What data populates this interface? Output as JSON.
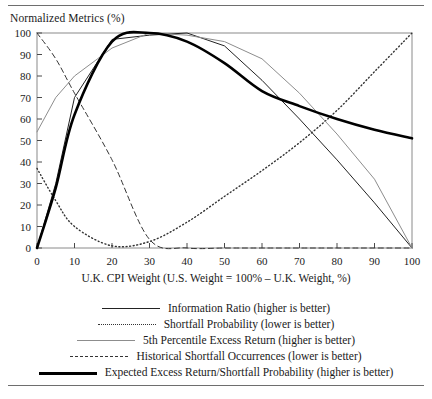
{
  "figure": {
    "y_axis_title": "Normalized Metrics (%)",
    "x_axis_title": "U.K. CPI Weight (U.S. Weight = 100% – U.K. Weight, %)"
  },
  "legend": {
    "entries": [
      {
        "label": "Information Ratio (higher is better)",
        "style": "solid-dark"
      },
      {
        "label": "Shortfall Probability (lower is better)",
        "style": "dotted"
      },
      {
        "label": "5th Percentile Excess Return (higher is better)",
        "style": "solid-light"
      },
      {
        "label": "Historical Shortfall Occurrences (lower is better)",
        "style": "dashed"
      },
      {
        "label": "Expected Excess Return/Shortfall Probability (higher is better)",
        "style": "bold"
      }
    ]
  },
  "chart_data": {
    "type": "line",
    "title": "",
    "xlabel": "U.K. CPI Weight (U.S. Weight = 100% – U.K. Weight, %)",
    "ylabel": "Normalized Metrics (%)",
    "xlim": [
      0,
      100
    ],
    "ylim": [
      0,
      100
    ],
    "grid": false,
    "legend_position": "below",
    "xticks": [
      0,
      10,
      20,
      30,
      40,
      50,
      60,
      70,
      80,
      90,
      100
    ],
    "yticks": [
      0,
      10,
      20,
      30,
      40,
      50,
      60,
      70,
      80,
      90,
      100
    ],
    "x": [
      0,
      5,
      10,
      20,
      30,
      40,
      50,
      60,
      70,
      80,
      90,
      100
    ],
    "series": [
      {
        "name": "Information Ratio (higher is better)",
        "style": "solid-dark",
        "color": "#222222",
        "values": [
          0,
          30,
          70,
          97,
          99,
          100,
          94,
          78,
          60,
          41,
          21,
          0
        ]
      },
      {
        "name": "Shortfall Probability (lower is better)",
        "style": "dotted",
        "color": "#333333",
        "values": [
          37,
          22,
          10,
          1,
          3,
          12,
          24,
          36,
          49,
          64,
          82,
          100
        ]
      },
      {
        "name": "5th Percentile Excess Return (higher is better)",
        "style": "solid-light",
        "color": "#8d8d8d",
        "values": [
          54,
          70,
          80,
          93,
          100,
          99,
          96,
          88,
          72,
          53,
          32,
          0
        ]
      },
      {
        "name": "Historical Shortfall Occurrences (lower is better)",
        "style": "dashed",
        "color": "#333333",
        "values": [
          100,
          88,
          72,
          41,
          4,
          0,
          0,
          0,
          0,
          0,
          0,
          0
        ]
      },
      {
        "name": "Expected Excess Return/Shortfall Probability (higher is better)",
        "style": "bold",
        "color": "#000000",
        "values": [
          0,
          28,
          62,
          96,
          100,
          96,
          86,
          73,
          66,
          60,
          55,
          51
        ]
      }
    ]
  }
}
